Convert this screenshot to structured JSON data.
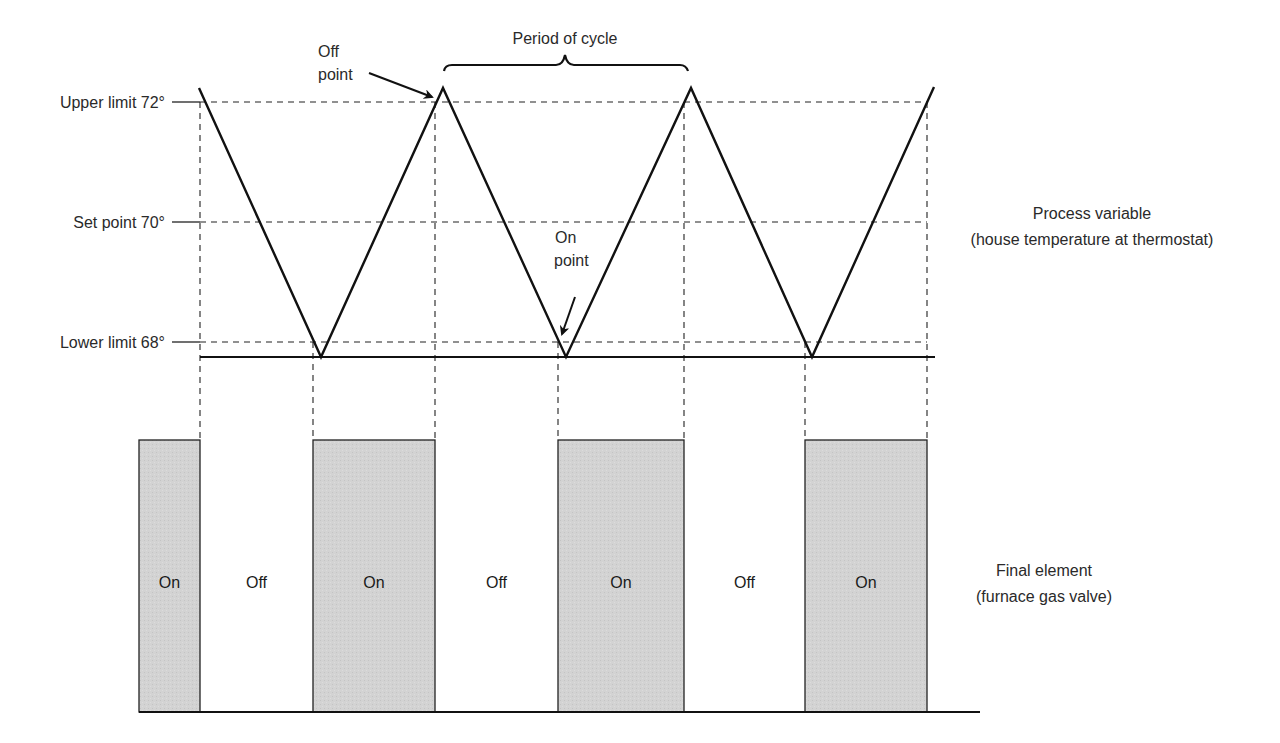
{
  "colors": {
    "background": "#ffffff",
    "line": "#111111",
    "text": "#2a2a2a",
    "on_fill": "#d2d2d2",
    "off_fill": "#ffffff"
  },
  "labels": {
    "upper_limit": "Upper limit 72°",
    "set_point": "Set point 70°",
    "lower_limit": "Lower limit 68°",
    "off_point_line1": "Off",
    "off_point_line2": "point",
    "on_point_line1": "On",
    "on_point_line2": "point",
    "period": "Period of cycle",
    "process_variable_line1": "Process variable",
    "process_variable_line2": "(house temperature at thermostat)",
    "final_element_line1": "Final element",
    "final_element_line2": "(furnace gas valve)"
  },
  "levels": {
    "upper_limit": {
      "value": 72,
      "y": 102
    },
    "set_point": {
      "value": 70,
      "y": 222
    },
    "lower_limit": {
      "value": 68,
      "y": 342
    },
    "peak_y": 88,
    "trough_y": 357
  },
  "wave_points": [
    [
      199,
      88
    ],
    [
      321,
      357
    ],
    [
      443,
      88
    ],
    [
      566,
      357
    ],
    [
      691,
      88
    ],
    [
      812,
      357
    ],
    [
      934,
      87
    ]
  ],
  "switch_x": [
    200,
    313,
    435,
    558,
    684,
    805,
    927
  ],
  "valve_segments": [
    {
      "state": "On",
      "x0": 139,
      "x1": 200
    },
    {
      "state": "Off",
      "x0": 200,
      "x1": 313
    },
    {
      "state": "On",
      "x0": 313,
      "x1": 435
    },
    {
      "state": "Off",
      "x0": 435,
      "x1": 558
    },
    {
      "state": "On",
      "x0": 558,
      "x1": 684
    },
    {
      "state": "Off",
      "x0": 684,
      "x1": 805
    },
    {
      "state": "On",
      "x0": 805,
      "x1": 927
    }
  ],
  "valve_geometry": {
    "top_y": 440,
    "bottom_y": 712,
    "baseline_x1": 980,
    "label_y": 588
  },
  "chart_data": {
    "type": "line",
    "title": "",
    "ylabel": "House temperature (°F)",
    "xlabel": "Time",
    "y_ticks": [
      {
        "label": "Upper limit 72°",
        "value": 72
      },
      {
        "label": "Set point 70°",
        "value": 70
      },
      {
        "label": "Lower limit 68°",
        "value": 68
      }
    ],
    "series": [
      {
        "name": "Process variable (house temperature at thermostat)",
        "shape": "triangle wave",
        "values": [
          72,
          68,
          72,
          68,
          72,
          68,
          72
        ]
      },
      {
        "name": "Final element (furnace gas valve)",
        "shape": "square wave",
        "states": [
          "On",
          "Off",
          "On",
          "Off",
          "On",
          "Off",
          "On"
        ]
      }
    ],
    "annotations": [
      "Off point",
      "On point",
      "Period of cycle"
    ]
  }
}
